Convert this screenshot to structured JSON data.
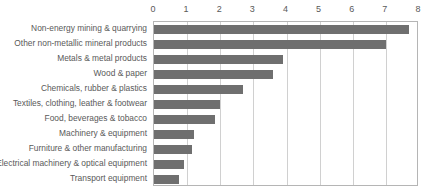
{
  "chart_data": {
    "type": "bar",
    "orientation": "horizontal",
    "title": "",
    "subtitle": "",
    "xlabel": "",
    "ylabel": "",
    "xlim": [
      0,
      8
    ],
    "ylim": null,
    "grid": "vertical",
    "legend": "none",
    "xticks": [
      "0",
      "1",
      "2",
      "3",
      "4",
      "5",
      "6",
      "7",
      "8"
    ],
    "xtick_values": [
      0,
      1,
      2,
      3,
      4,
      5,
      6,
      7,
      8
    ],
    "bar_color": "#6f6f6f",
    "gridline_color": "#d0d0d0",
    "axis_color": "#b5b5b5",
    "text_color": "#595959",
    "categories": [
      "Non-energy mining & quarrying",
      "Other non-metallic mineral products",
      "Metals & metal products",
      "Wood & paper",
      "Chemicals, rubber & plastics",
      "Textiles, clothing, leather & footwear",
      "Food, beverages & tobacco",
      "Machinery & equipment",
      "Furniture & other manufacturing",
      "Electrical machinery & optical equipment",
      "Transport equipment"
    ],
    "values": [
      7.7,
      7.0,
      3.9,
      3.6,
      2.7,
      2.0,
      1.85,
      1.2,
      1.15,
      0.9,
      0.75
    ]
  }
}
